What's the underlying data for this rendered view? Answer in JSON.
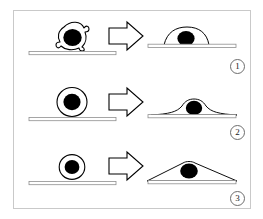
{
  "figure": {
    "background_color": "#ffffff",
    "frame_color": "#c9c9c9",
    "outline_color": "#000000",
    "nucleus_color": "#000000",
    "substrate_color": "#9a9a9a"
  },
  "panels": [
    {
      "index_label": "1",
      "before": {
        "shape_name": "round-cell-large-irregular",
        "description": "Large round cell with ruffled membrane resting on substrate",
        "cell_radius": 17,
        "nucleus_radius": 9
      },
      "arrow": {
        "icon": "block-arrow-right-icon",
        "direction": "right"
      },
      "after": {
        "shape_name": "spread-cell-dome",
        "description": "Cell spread into tall dome shape on substrate",
        "spread_width": 44,
        "spread_height": 13
      }
    },
    {
      "index_label": "2",
      "before": {
        "shape_name": "round-cell-medium",
        "description": "Medium round cell resting on substrate",
        "cell_radius": 14,
        "nucleus_radius": 8
      },
      "arrow": {
        "icon": "block-arrow-right-icon",
        "direction": "right"
      },
      "after": {
        "shape_name": "spread-cell-flat-wide",
        "description": "Cell spread into wide flat lamella with thin tapering edges",
        "spread_width": 86,
        "spread_height": 9
      }
    },
    {
      "index_label": "3",
      "before": {
        "shape_name": "round-cell-small",
        "description": "Small round cell resting on substrate",
        "cell_radius": 12,
        "nucleus_radius": 7
      },
      "arrow": {
        "icon": "block-arrow-right-icon",
        "direction": "right"
      },
      "after": {
        "shape_name": "spread-cell-triangular",
        "description": "Cell spread into the widest flattest triangular tent shape",
        "spread_width": 102,
        "spread_height": 11
      }
    }
  ]
}
